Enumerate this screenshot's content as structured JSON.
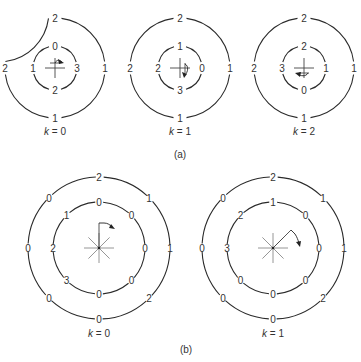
{
  "figure": {
    "part_a": {
      "label": "(a)",
      "diagrams": [
        {
          "caption_var": "k",
          "caption_eq": " = 0",
          "center": [
            55,
            68
          ],
          "outer_labels": {
            "top": "2",
            "left": "2",
            "right": "1",
            "bottom": "1"
          },
          "inner_labels": {
            "top": "0",
            "left": "1",
            "right": "3",
            "bottom": "2"
          },
          "arrow_direction": "clockwise-start-north"
        },
        {
          "caption_var": "k",
          "caption_eq": " = 1",
          "center": [
            180,
            68
          ],
          "outer_labels": {
            "top": "2",
            "left": "2",
            "right": "1",
            "bottom": "1"
          },
          "inner_labels": {
            "top": "1",
            "left": "2",
            "right": "0",
            "bottom": "3"
          },
          "arrow_direction": "clockwise-start-east"
        },
        {
          "caption_var": "k",
          "caption_eq": " = 2",
          "center": [
            304,
            68
          ],
          "outer_labels": {
            "top": "2",
            "left": "2",
            "right": "1",
            "bottom": "1"
          },
          "inner_labels": {
            "top": "2",
            "left": "3",
            "right": "1",
            "bottom": "0"
          },
          "arrow_direction": "clockwise-start-south"
        }
      ]
    },
    "part_b": {
      "label": "(b)",
      "diagrams": [
        {
          "caption_var": "k",
          "caption_eq": " = 0",
          "center": [
            99,
            248
          ],
          "outer_labels": [
            "2",
            "1",
            "1",
            "2",
            "0",
            "0",
            "0",
            "0"
          ],
          "inner_labels": [
            "0",
            "0",
            "0",
            "0",
            "0",
            "3",
            "2",
            "1"
          ]
        },
        {
          "caption_var": "k",
          "caption_eq": " = 1",
          "center": [
            273,
            248
          ],
          "outer_labels": [
            "2",
            "1",
            "1",
            "2",
            "0",
            "0",
            "0",
            "0"
          ],
          "inner_labels": [
            "1",
            "0",
            "0",
            "0",
            "0",
            "0",
            "3",
            "2"
          ]
        }
      ]
    }
  }
}
